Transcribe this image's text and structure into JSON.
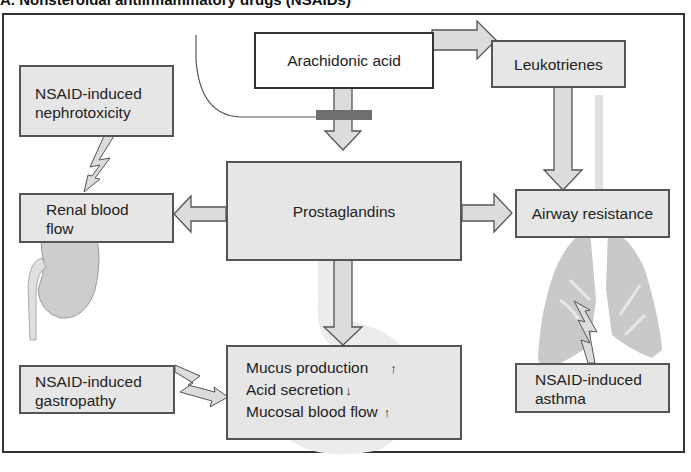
{
  "title": "A. Nonsteroidal antiinflammatory drugs (NSAIDs)",
  "nodes": {
    "arachidonic_acid": "Arachidonic acid",
    "leukotrienes": "Leukotrienes",
    "prostaglandins": "Prostaglandins",
    "nephrotoxicity": [
      "NSAID-induced",
      "nephrotoxicity"
    ],
    "renal_blood_flow": [
      "Renal blood",
      "flow"
    ],
    "airway_resistance": "Airway resistance",
    "asthma": [
      "NSAID-induced",
      "asthma"
    ],
    "gastropathy": [
      "NSAID-induced",
      "gastropathy"
    ],
    "gastric_effects": [
      {
        "label": "Mucus production",
        "direction": "↑"
      },
      {
        "label": "Acid secretion",
        "direction": "↓"
      },
      {
        "label": "Mucosal blood flow",
        "direction": "↑"
      }
    ]
  },
  "edges": [
    {
      "from": "arachidonic_acid",
      "to": "prostaglandins",
      "type": "block-arrow",
      "inhibited": true,
      "inhibitor": "NSAID"
    },
    {
      "from": "arachidonic_acid",
      "to": "leukotrienes",
      "type": "block-arrow"
    },
    {
      "from": "leukotrienes",
      "to": "airway_resistance",
      "type": "block-arrow"
    },
    {
      "from": "prostaglandins",
      "to": "renal_blood_flow",
      "type": "block-arrow"
    },
    {
      "from": "prostaglandins",
      "to": "airway_resistance",
      "type": "block-arrow"
    },
    {
      "from": "prostaglandins",
      "to": "gastric_effects",
      "type": "block-arrow"
    },
    {
      "from": "nephrotoxicity",
      "to": "renal_blood_flow",
      "type": "lightning"
    },
    {
      "from": "asthma",
      "to": "airway_resistance",
      "type": "lightning"
    },
    {
      "from": "gastropathy",
      "to": "gastric_effects",
      "type": "lightning"
    }
  ],
  "illustrations": [
    "kidney-illustration",
    "lungs-illustration",
    "stomach-illustration"
  ],
  "colors": {
    "box_fill": "#e6e6e6",
    "box_border": "#555555",
    "arrow_fill": "#dcdcdc",
    "inhibitor_bar": "#6e6e6e",
    "illustration": "#c8c8c8",
    "frame": "#333333"
  }
}
